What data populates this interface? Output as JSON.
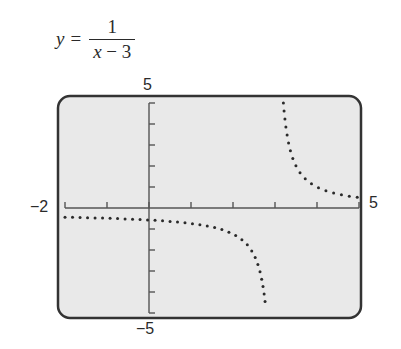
{
  "equation": {
    "lhs": "y",
    "equals": "=",
    "numerator": "1",
    "denominator_var": "x",
    "denominator_rest": " − 3"
  },
  "labels": {
    "ymax": "5",
    "ymin": "−5",
    "xmin": "−2",
    "xmax": "5"
  },
  "colors": {
    "screen_bg": "#e9e9e9",
    "frame": "#333333",
    "axis": "#555555",
    "dots": "#2a2a2a"
  },
  "chart_data": {
    "type": "scatter",
    "xlabel": "",
    "ylabel": "",
    "xlim": [
      -2,
      5
    ],
    "ylim": [
      -5,
      5
    ],
    "xticks": [
      -2,
      -1,
      0,
      1,
      2,
      3,
      4,
      5
    ],
    "yticks": [
      -5,
      -4,
      -3,
      -2,
      -1,
      0,
      1,
      2,
      3,
      4,
      5
    ],
    "grid": false,
    "style": "dotted graphing-calculator plot",
    "asymptote_x": 3,
    "series": [
      {
        "name": "left branch (x < 3)",
        "x": [
          -2,
          -1,
          0,
          1,
          2,
          2.5,
          2.8
        ],
        "y": [
          -0.2,
          -0.25,
          -0.333,
          -0.5,
          -1,
          -2,
          -5
        ]
      },
      {
        "name": "right branch (x > 3)",
        "x": [
          3.2,
          3.5,
          4,
          4.5,
          5
        ],
        "y": [
          5,
          2,
          1,
          0.667,
          0.5
        ]
      }
    ]
  }
}
